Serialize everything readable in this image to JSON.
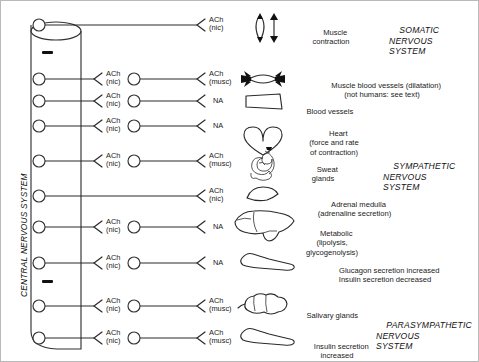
{
  "diagram": {
    "cns_label": "CENTRAL NERVOUS SYSTEM",
    "systems": [
      {
        "id": "somatic",
        "lines": [
          "SOMATIC",
          "NERVOUS",
          "SYSTEM"
        ]
      },
      {
        "id": "sympathetic",
        "lines": [
          "SYMPATHETIC",
          "NERVOUS",
          "SYSTEM"
        ]
      },
      {
        "id": "parasympathetic",
        "lines": [
          "PARASYMPATHETIC",
          "NERVOUS",
          "SYSTEM"
        ]
      }
    ],
    "transmitters": {
      "ach_nic": [
        "ACh",
        "(nic)"
      ],
      "ach_musc": [
        "ACh",
        "(musc)"
      ],
      "na": [
        "NA"
      ]
    },
    "rows": [
      {
        "id": "somatic-muscle",
        "system": "somatic",
        "has_ganglion": false,
        "preganglionic_transmitter": null,
        "terminal_transmitter": "ach_nic",
        "organ_icon": "skeletal-muscle-icon",
        "organ_lines": [
          "Muscle",
          "contraction"
        ],
        "organ_align": "center"
      },
      {
        "id": "muscle-blood-vessels",
        "system": "sympathetic",
        "has_ganglion": true,
        "preganglionic_transmitter": "ach_nic",
        "terminal_transmitter": "ach_musc",
        "organ_icon": "dilated-vessel-icon",
        "organ_lines": [
          "Muscle blood vessels (dilatation)",
          "(not humans: see text)"
        ],
        "organ_align": "center"
      },
      {
        "id": "blood-vessels",
        "system": "sympathetic",
        "has_ganglion": true,
        "preganglionic_transmitter": "ach_nic",
        "terminal_transmitter": "na",
        "organ_icon": "blood-vessel-icon",
        "organ_lines": [
          "Blood vessels"
        ],
        "organ_align": "left"
      },
      {
        "id": "heart",
        "system": "sympathetic",
        "has_ganglion": true,
        "preganglionic_transmitter": "ach_nic",
        "terminal_transmitter": "na",
        "organ_icon": "heart-icon",
        "organ_lines": [
          "Heart",
          "(force and rate",
          "of contraction)"
        ],
        "organ_align": "center"
      },
      {
        "id": "sweat-glands",
        "system": "sympathetic",
        "has_ganglion": true,
        "preganglionic_transmitter": "ach_nic",
        "terminal_transmitter": "ach_musc",
        "organ_icon": "sweat-gland-icon",
        "organ_lines": [
          "Sweat",
          "glands"
        ],
        "organ_align": "center"
      },
      {
        "id": "adrenal-medulla",
        "system": "sympathetic",
        "has_ganglion": false,
        "preganglionic_transmitter": null,
        "terminal_transmitter": "ach_nic",
        "organ_icon": "adrenal-medulla-icon",
        "organ_lines": [
          "Adrenal medulla",
          "(adrenaline secretion)"
        ],
        "organ_align": "center"
      },
      {
        "id": "liver-metabolic",
        "system": "sympathetic",
        "has_ganglion": true,
        "preganglionic_transmitter": "ach_nic",
        "terminal_transmitter": "na",
        "organ_icon": "liver-icon",
        "organ_lines": [
          "Metabolic",
          "(lipolysis,",
          "glycogenolysis)"
        ],
        "organ_align": "center"
      },
      {
        "id": "pancreas-sympathetic",
        "system": "sympathetic",
        "has_ganglion": true,
        "preganglionic_transmitter": "ach_nic",
        "terminal_transmitter": "na",
        "organ_icon": "pancreas-icon",
        "organ_lines": [
          "Glucagon secretion increased",
          "Insulin secretion decreased"
        ],
        "organ_align": "center"
      },
      {
        "id": "salivary-glands",
        "system": "parasympathetic",
        "has_ganglion": true,
        "preganglionic_transmitter": "ach_nic",
        "terminal_transmitter": "ach_musc",
        "organ_icon": "salivary-gland-icon",
        "organ_lines": [
          "Salivary glands"
        ],
        "organ_align": "left"
      },
      {
        "id": "pancreas-parasympathetic",
        "system": "parasympathetic",
        "has_ganglion": true,
        "preganglionic_transmitter": "ach_nic",
        "terminal_transmitter": "ach_musc",
        "organ_icon": "pancreas-icon",
        "organ_lines": [
          "Insulin secretion",
          "increased"
        ],
        "organ_align": "center"
      }
    ],
    "separator_marks": 2,
    "colors": {
      "stroke": "#1a1a1a",
      "text": "#1a1a1a",
      "background": "#ffffff",
      "border": "#b9b9b9"
    }
  }
}
